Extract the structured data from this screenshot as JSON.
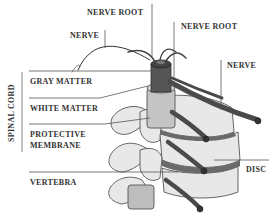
{
  "diagram": {
    "type": "anatomical-illustration",
    "colors": {
      "background": "#ffffff",
      "label_text": "#333333",
      "leader_line": "#555555",
      "bone": "#e6e6e6",
      "bone_outline": "#555555",
      "cord_dark": "#555555",
      "cord_mid": "#777777",
      "membrane": "#bdbdbd",
      "nerve": "#4a4a4a"
    },
    "labels": {
      "nerve_root_1": "NERVE ROOT",
      "nerve_root_2": "NERVE ROOT",
      "nerve_left": "NERVE",
      "nerve_right": "NERVE",
      "gray_matter": "GRAY MATTER",
      "white_matter": "WHITE MATTER",
      "protective_membrane_line1": "PROTECTIVE",
      "protective_membrane_line2": "MEMBRANE",
      "vertebra": "VERTEBRA",
      "disc": "DISC",
      "spinal_cord_group": "SPINAL CORD"
    }
  }
}
